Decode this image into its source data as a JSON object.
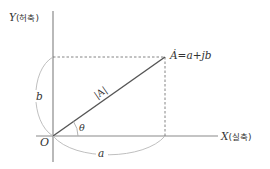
{
  "diagram": {
    "y_axis": {
      "var": "Y",
      "paren_open": "(",
      "name": "허축",
      "paren_close": ")"
    },
    "x_axis": {
      "var": "X",
      "paren_open": "(",
      "name": "실축",
      "paren_close": ")"
    },
    "origin_label": "O",
    "phasor_label": "Ȧ=a+jb",
    "magnitude_label": "|A|",
    "angle_label": "θ",
    "real_component_label": "a",
    "imag_component_label": "b"
  },
  "colors": {
    "axis": "#8a8a8a",
    "vector": "#555555",
    "dashed": "#777777",
    "arc": "#b0b0b0",
    "text": "#333333"
  }
}
